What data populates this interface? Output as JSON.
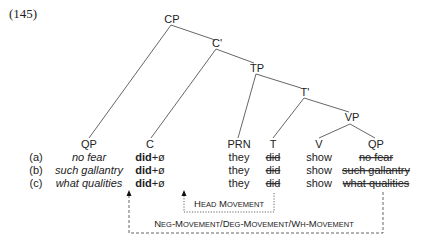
{
  "example_number": "(145)",
  "tree": {
    "nodes": {
      "cp": "CP",
      "c_bar": "C'",
      "tp": "TP",
      "t_bar": "T'",
      "vp": "VP"
    },
    "terminals": [
      "QP",
      "C",
      "PRN",
      "T",
      "V",
      "QP"
    ]
  },
  "rows": [
    {
      "label": "(a)",
      "qp": "no fear",
      "c_did": "did",
      "c_suffix": "+ø",
      "prn": "they",
      "t": "did",
      "v": "show",
      "qp_trace": "no fear"
    },
    {
      "label": "(b)",
      "qp": "such gallantry",
      "c_did": "did",
      "c_suffix": "+ø",
      "prn": "they",
      "t": "did",
      "v": "show",
      "qp_trace": "such gallantry"
    },
    {
      "label": "(c)",
      "qp": "what qualities",
      "c_did": "did",
      "c_suffix": "+ø",
      "prn": "they",
      "t": "did",
      "v": "show",
      "qp_trace": "what qualities"
    }
  ],
  "arrows": {
    "head_movement": {
      "H": "H",
      "ead": "EAD",
      "M": "M",
      "ovement": "OVEMENT"
    },
    "phrasal_movement": {
      "p1_N": "N",
      "p1_eg": "EG",
      "dash1": "-",
      "p1_M": "M",
      "p1_ovement": "OVEMENT",
      "slash1": "/",
      "p2_D": "D",
      "p2_eg": "EG",
      "dash2": "-",
      "p2_M": "M",
      "p2_ovement": "OVEMENT",
      "slash2": "/",
      "p3_W": "W",
      "p3_h": "H",
      "dash3": "-",
      "p3_M": "M",
      "p3_ovement": "OVEMENT"
    }
  }
}
